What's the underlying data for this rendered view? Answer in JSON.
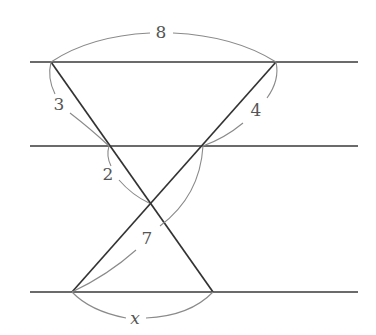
{
  "diagram": {
    "parallel_lines": [
      {
        "name": "top",
        "y": 62,
        "x1": 30,
        "x2": 358
      },
      {
        "name": "middle",
        "y": 146,
        "x1": 30,
        "x2": 358
      },
      {
        "name": "bottom",
        "y": 292,
        "x1": 30,
        "x2": 358
      }
    ],
    "points": {
      "top_left": [
        51,
        62
      ],
      "top_right": [
        276,
        62
      ],
      "mid_left": [
        109,
        146
      ],
      "mid_right": [
        203,
        146
      ],
      "cross": [
        149,
        203
      ],
      "bottom_left": [
        72,
        292
      ],
      "bottom_right": [
        213,
        292
      ]
    },
    "labels": {
      "top_width": "8",
      "left_upper": "3",
      "left_lower": "2",
      "right_upper": "4",
      "right_lower": "7",
      "bottom_width": "x"
    },
    "colors": {
      "line": "#333333",
      "arc": "#8a8a8a",
      "text": "#555555",
      "background": "#ffffff"
    }
  }
}
